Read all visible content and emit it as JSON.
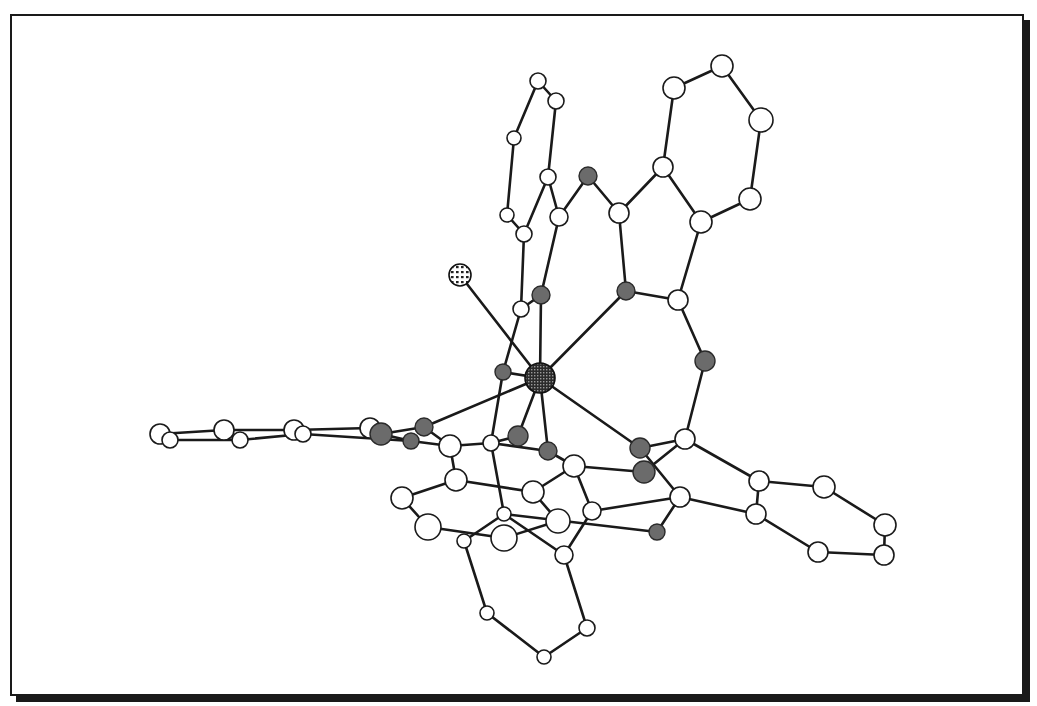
{
  "figure": {
    "type": "molecular-structure",
    "frame": {
      "border_color": "#1a1a1a",
      "shadow": true
    },
    "atom_types": {
      "metal": {
        "fill": "crosshatched-dark",
        "legend": "central metal atom"
      },
      "halide": {
        "fill": "dotted",
        "legend": "terminal ligand atom"
      },
      "heteroatom": {
        "fill": "#6b6b6b",
        "legend": "N/O donor atoms (shaded)"
      },
      "carbon": {
        "fill": "#ffffff",
        "legend": "carbon atoms (open circles)"
      }
    },
    "atoms": [
      {
        "id": "M",
        "type": "metal",
        "x": 540,
        "y": 378,
        "r": 15
      },
      {
        "id": "X",
        "type": "halide",
        "x": 460,
        "y": 275,
        "r": 11
      },
      {
        "id": "N1",
        "type": "heteroatom",
        "x": 541,
        "y": 295,
        "r": 9
      },
      {
        "id": "N2",
        "type": "heteroatom",
        "x": 626,
        "y": 291,
        "r": 9
      },
      {
        "id": "N3",
        "type": "heteroatom",
        "x": 705,
        "y": 361,
        "r": 10
      },
      {
        "id": "N4",
        "type": "heteroatom",
        "x": 588,
        "y": 176,
        "r": 9
      },
      {
        "id": "N5",
        "type": "heteroatom",
        "x": 503,
        "y": 372,
        "r": 8
      },
      {
        "id": "N6",
        "type": "heteroatom",
        "x": 424,
        "y": 427,
        "r": 9
      },
      {
        "id": "N7",
        "type": "heteroatom",
        "x": 381,
        "y": 434,
        "r": 11
      },
      {
        "id": "N8",
        "type": "heteroatom",
        "x": 411,
        "y": 441,
        "r": 8
      },
      {
        "id": "N9",
        "type": "heteroatom",
        "x": 518,
        "y": 436,
        "r": 10
      },
      {
        "id": "N10",
        "type": "heteroatom",
        "x": 548,
        "y": 451,
        "r": 9
      },
      {
        "id": "N11",
        "type": "heteroatom",
        "x": 640,
        "y": 448,
        "r": 10
      },
      {
        "id": "N12",
        "type": "heteroatom",
        "x": 644,
        "y": 472,
        "r": 11
      },
      {
        "id": "N13",
        "type": "heteroatom",
        "x": 657,
        "y": 532,
        "r": 8
      },
      {
        "id": "C1",
        "type": "carbon",
        "x": 538,
        "y": 81,
        "r": 8
      },
      {
        "id": "C2",
        "type": "carbon",
        "x": 556,
        "y": 101,
        "r": 8
      },
      {
        "id": "C3",
        "type": "carbon",
        "x": 514,
        "y": 138,
        "r": 7
      },
      {
        "id": "C4",
        "type": "carbon",
        "x": 548,
        "y": 177,
        "r": 8
      },
      {
        "id": "C5",
        "type": "carbon",
        "x": 507,
        "y": 215,
        "r": 7
      },
      {
        "id": "C6",
        "type": "carbon",
        "x": 524,
        "y": 234,
        "r": 8
      },
      {
        "id": "C7",
        "type": "carbon",
        "x": 559,
        "y": 217,
        "r": 9
      },
      {
        "id": "C8",
        "type": "carbon",
        "x": 521,
        "y": 309,
        "r": 8
      },
      {
        "id": "C9",
        "type": "carbon",
        "x": 619,
        "y": 213,
        "r": 10
      },
      {
        "id": "C10",
        "type": "carbon",
        "x": 663,
        "y": 167,
        "r": 10
      },
      {
        "id": "C11",
        "type": "carbon",
        "x": 701,
        "y": 222,
        "r": 11
      },
      {
        "id": "C12",
        "type": "carbon",
        "x": 674,
        "y": 88,
        "r": 11
      },
      {
        "id": "C13",
        "type": "carbon",
        "x": 722,
        "y": 66,
        "r": 11
      },
      {
        "id": "C14",
        "type": "carbon",
        "x": 761,
        "y": 120,
        "r": 12
      },
      {
        "id": "C15",
        "type": "carbon",
        "x": 750,
        "y": 199,
        "r": 11
      },
      {
        "id": "C16",
        "type": "carbon",
        "x": 678,
        "y": 300,
        "r": 10
      },
      {
        "id": "C17",
        "type": "carbon",
        "x": 685,
        "y": 439,
        "r": 10
      },
      {
        "id": "C18",
        "type": "carbon",
        "x": 160,
        "y": 434,
        "r": 10
      },
      {
        "id": "C19",
        "type": "carbon",
        "x": 170,
        "y": 440,
        "r": 8
      },
      {
        "id": "C20",
        "type": "carbon",
        "x": 224,
        "y": 430,
        "r": 10
      },
      {
        "id": "C21",
        "type": "carbon",
        "x": 240,
        "y": 440,
        "r": 8
      },
      {
        "id": "C22",
        "type": "carbon",
        "x": 294,
        "y": 430,
        "r": 10
      },
      {
        "id": "C23",
        "type": "carbon",
        "x": 303,
        "y": 434,
        "r": 8
      },
      {
        "id": "C24",
        "type": "carbon",
        "x": 370,
        "y": 428,
        "r": 10
      },
      {
        "id": "C25",
        "type": "carbon",
        "x": 450,
        "y": 446,
        "r": 11
      },
      {
        "id": "C26",
        "type": "carbon",
        "x": 491,
        "y": 443,
        "r": 8
      },
      {
        "id": "C27",
        "type": "carbon",
        "x": 456,
        "y": 480,
        "r": 11
      },
      {
        "id": "C28",
        "type": "carbon",
        "x": 402,
        "y": 498,
        "r": 11
      },
      {
        "id": "C29",
        "type": "carbon",
        "x": 428,
        "y": 527,
        "r": 13
      },
      {
        "id": "C30",
        "type": "carbon",
        "x": 533,
        "y": 492,
        "r": 11
      },
      {
        "id": "C31",
        "type": "carbon",
        "x": 504,
        "y": 514,
        "r": 7
      },
      {
        "id": "C32",
        "type": "carbon",
        "x": 504,
        "y": 538,
        "r": 13
      },
      {
        "id": "C33",
        "type": "carbon",
        "x": 558,
        "y": 521,
        "r": 12
      },
      {
        "id": "C34",
        "type": "carbon",
        "x": 464,
        "y": 541,
        "r": 7
      },
      {
        "id": "C35",
        "type": "carbon",
        "x": 574,
        "y": 466,
        "r": 11
      },
      {
        "id": "C36",
        "type": "carbon",
        "x": 592,
        "y": 511,
        "r": 9
      },
      {
        "id": "C37",
        "type": "carbon",
        "x": 564,
        "y": 555,
        "r": 9
      },
      {
        "id": "C38",
        "type": "carbon",
        "x": 487,
        "y": 613,
        "r": 7
      },
      {
        "id": "C39",
        "type": "carbon",
        "x": 587,
        "y": 628,
        "r": 8
      },
      {
        "id": "C40",
        "type": "carbon",
        "x": 544,
        "y": 657,
        "r": 7
      },
      {
        "id": "C41",
        "type": "carbon",
        "x": 680,
        "y": 497,
        "r": 10
      },
      {
        "id": "C42",
        "type": "carbon",
        "x": 759,
        "y": 481,
        "r": 10
      },
      {
        "id": "C43",
        "type": "carbon",
        "x": 756,
        "y": 514,
        "r": 10
      },
      {
        "id": "C44",
        "type": "carbon",
        "x": 824,
        "y": 487,
        "r": 11
      },
      {
        "id": "C45",
        "type": "carbon",
        "x": 885,
        "y": 525,
        "r": 11
      },
      {
        "id": "C46",
        "type": "carbon",
        "x": 884,
        "y": 555,
        "r": 10
      },
      {
        "id": "C47",
        "type": "carbon",
        "x": 818,
        "y": 552,
        "r": 10
      }
    ],
    "bonds": [
      [
        "M",
        "X"
      ],
      [
        "M",
        "N1"
      ],
      [
        "M",
        "N2"
      ],
      [
        "M",
        "N5"
      ],
      [
        "M",
        "N9"
      ],
      [
        "M",
        "N10"
      ],
      [
        "M",
        "N11"
      ],
      [
        "M",
        "N6"
      ],
      [
        "C1",
        "C2"
      ],
      [
        "C1",
        "C3"
      ],
      [
        "C3",
        "C5"
      ],
      [
        "C5",
        "C6"
      ],
      [
        "C2",
        "C4"
      ],
      [
        "C4",
        "C6"
      ],
      [
        "C4",
        "C7"
      ],
      [
        "C6",
        "C8"
      ],
      [
        "C8",
        "N5"
      ],
      [
        "C8",
        "C8b"
      ],
      [
        "C7",
        "N1"
      ],
      [
        "C7",
        "N4"
      ],
      [
        "N4",
        "C9"
      ],
      [
        "C9",
        "C10"
      ],
      [
        "C9",
        "N2"
      ],
      [
        "C10",
        "C11"
      ],
      [
        "C10",
        "C12"
      ],
      [
        "C12",
        "C13"
      ],
      [
        "C13",
        "C14"
      ],
      [
        "C14",
        "C15"
      ],
      [
        "C15",
        "C11"
      ],
      [
        "C11",
        "C16"
      ],
      [
        "N2",
        "C16"
      ],
      [
        "C16",
        "N3"
      ],
      [
        "N3",
        "C17"
      ],
      [
        "C17",
        "N11"
      ],
      [
        "C17",
        "N12"
      ],
      [
        "C17",
        "C42"
      ],
      [
        "C18",
        "C20"
      ],
      [
        "C19",
        "C21"
      ],
      [
        "C18",
        "C19"
      ],
      [
        "C20",
        "C21"
      ],
      [
        "C20",
        "C22"
      ],
      [
        "C21",
        "C23"
      ],
      [
        "C22",
        "C23"
      ],
      [
        "C22",
        "C24"
      ],
      [
        "C23",
        "N8"
      ],
      [
        "C24",
        "N7"
      ],
      [
        "N7",
        "N6"
      ],
      [
        "N7",
        "N8"
      ],
      [
        "N8",
        "C25"
      ],
      [
        "N6",
        "C25"
      ],
      [
        "C25",
        "C26"
      ],
      [
        "C26",
        "N10"
      ],
      [
        "C25",
        "C27"
      ],
      [
        "C27",
        "C28"
      ],
      [
        "C28",
        "C29"
      ],
      [
        "C29",
        "C32"
      ],
      [
        "C27",
        "C30"
      ],
      [
        "C30",
        "C33"
      ],
      [
        "C32",
        "C33"
      ],
      [
        "C30",
        "C35"
      ],
      [
        "C26",
        "C31"
      ],
      [
        "C31",
        "C34"
      ],
      [
        "C31",
        "C37"
      ],
      [
        "C34",
        "C38"
      ],
      [
        "C38",
        "C40"
      ],
      [
        "C40",
        "C39"
      ],
      [
        "C39",
        "C37"
      ],
      [
        "C37",
        "C36"
      ],
      [
        "C36",
        "C41"
      ],
      [
        "C35",
        "N12"
      ],
      [
        "C35",
        "C36"
      ],
      [
        "N10",
        "C35"
      ],
      [
        "N9",
        "C26"
      ],
      [
        "N11",
        "C41"
      ],
      [
        "C41",
        "N13"
      ],
      [
        "N13",
        "C31"
      ],
      [
        "C41",
        "C43"
      ],
      [
        "C42",
        "C43"
      ],
      [
        "C42",
        "C44"
      ],
      [
        "C44",
        "C45"
      ],
      [
        "C45",
        "C46"
      ],
      [
        "C46",
        "C47"
      ],
      [
        "C47",
        "C43"
      ],
      [
        "N5",
        "C26"
      ],
      [
        "N1",
        "C8"
      ]
    ]
  }
}
